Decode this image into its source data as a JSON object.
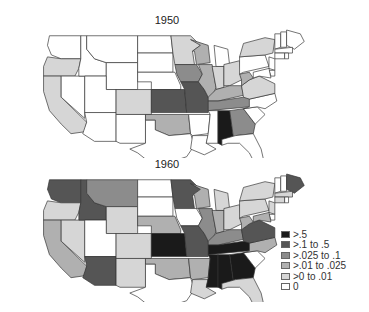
{
  "chart_data": {
    "type": "choropleth",
    "region": "Contiguous United States",
    "panels": [
      {
        "title": "1950",
        "states": {
          "WA": "0",
          "OR": ">0 to .01",
          "CA": ">0 to .01",
          "NV": "0",
          "ID": "0",
          "MT": "0",
          "WY": "0",
          "UT": "0",
          "AZ": "0",
          "CO": ">0 to .01",
          "NM": "0",
          "ND": "0",
          "SD": "0",
          "NE": "0",
          "KS": ">.1 to .5",
          "OK": ">.01 to .025",
          "TX": "0",
          "MN": ">0 to .01",
          "IA": ">.025 to .1",
          "MO": ">.1 to .5",
          "AR": "0",
          "LA": "0",
          "WI": ">.01 to .025",
          "IL": ">.01 to .025",
          "MI": "0",
          "IN": ">0 to .01",
          "OH": ">0 to .01",
          "KY": ">.01 to .025",
          "TN": ">.025 to .1",
          "MS": "0",
          "AL": ">.5",
          "GA": ">.025 to .1",
          "FL": "0",
          "SC": "0",
          "NC": "0",
          "VA": ">0 to .01",
          "WV": ">.01 to .025",
          "PA": "0",
          "NY": ">0 to .01",
          "VT": "0",
          "NH": "0",
          "ME": "0",
          "MA": "0",
          "CT": "0",
          "RI": "0",
          "NJ": "0",
          "DE": "0",
          "MD": "0"
        }
      },
      {
        "title": "1960",
        "states": {
          "WA": ">.1 to .5",
          "OR": ">0 to .01",
          "CA": ">.01 to .025",
          "NV": ">0 to .01",
          "ID": ">.1 to .5",
          "MT": ">.025 to .1",
          "WY": ">0 to .01",
          "UT": "0",
          "AZ": ">.1 to .5",
          "CO": ">0 to .01",
          "NM": ">0 to .01",
          "ND": "0",
          "SD": "0",
          "NE": ">.01 to .025",
          "KS": ">.5",
          "OK": ">.01 to .025",
          "TX": "0",
          "MN": ">.1 to .5",
          "IA": "0",
          "MO": ">.1 to .5",
          "AR": ">.01 to .025",
          "LA": ">0 to .01",
          "WI": ">.01 to .025",
          "IL": ">.025 to .1",
          "MI": ">0 to .01",
          "IN": ">.01 to .025",
          "OH": ">0 to .01",
          "KY": ">.025 to .1",
          "TN": ">.5",
          "MS": ">.5",
          "AL": ">.5",
          "GA": ">.5",
          "FL": ">0 to .01",
          "SC": "0",
          "NC": ">.01 to .025",
          "VA": ">.1 to .5",
          "WV": ">.01 to .025",
          "PA": ">0 to .01",
          "NY": ">0 to .01",
          "VT": "0",
          "NH": "0",
          "ME": ">.1 to .5",
          "MA": ">0 to .01",
          "CT": ">0 to .01",
          "RI": "0",
          "NJ": ">0 to .01",
          "DE": "0",
          "MD": ">.01 to .025"
        }
      }
    ],
    "legend": [
      {
        "label": ">.5",
        "color": "#1a1a1a"
      },
      {
        "label": ">.1 to .5",
        "color": "#555555"
      },
      {
        "label": ">.025 to .1",
        "color": "#8c8c8c"
      },
      {
        "label": ">.01 to .025",
        "color": "#b0b0b0"
      },
      {
        "label": ">0 to .01",
        "color": "#d6d6d6"
      },
      {
        "label": "0",
        "color": "#ffffff"
      }
    ],
    "legend_position": "lower right"
  },
  "titles": {
    "t1950": "1950",
    "t1960": "1960"
  },
  "legend_labels": [
    ">.5",
    ">.1 to .5",
    ">.025 to .1",
    ">.01 to .025",
    ">0 to .01",
    "0"
  ]
}
